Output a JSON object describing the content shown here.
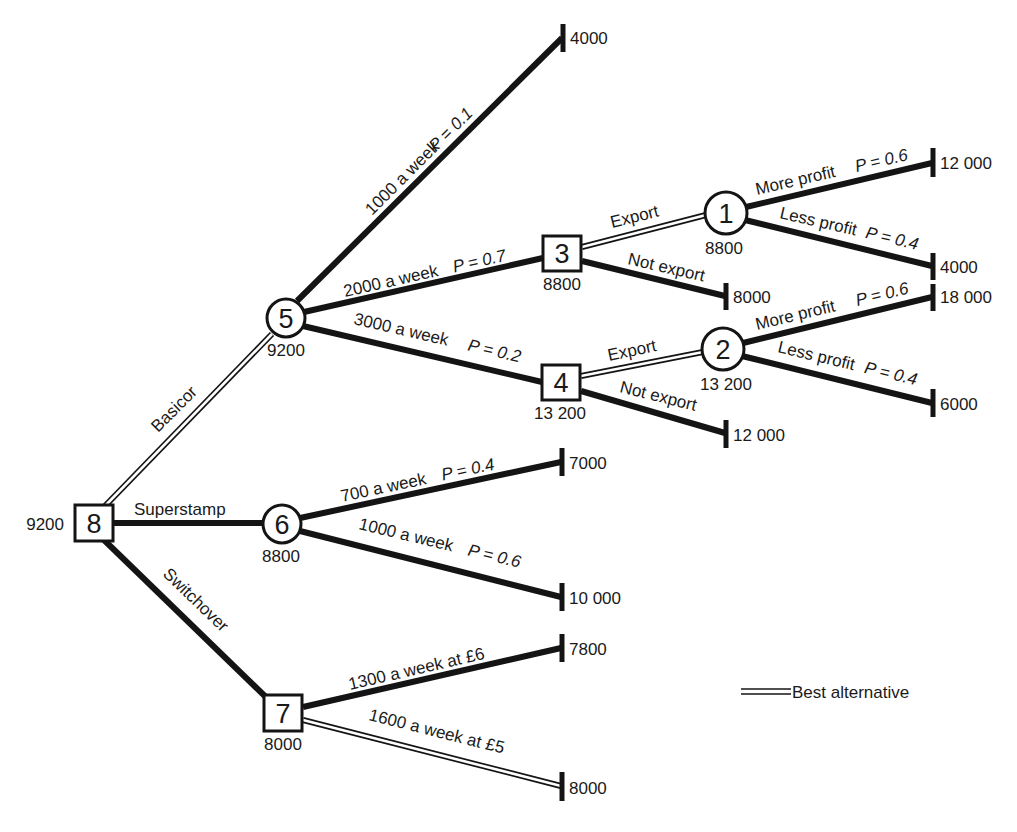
{
  "diagram": {
    "type": "decision-tree",
    "nodes": [
      {
        "id": "8",
        "kind": "decision",
        "value": "9200"
      },
      {
        "id": "5",
        "kind": "chance",
        "value": "9200"
      },
      {
        "id": "6",
        "kind": "chance",
        "value": "8800"
      },
      {
        "id": "7",
        "kind": "decision",
        "value": "8000"
      },
      {
        "id": "3",
        "kind": "decision",
        "value": "8800"
      },
      {
        "id": "4",
        "kind": "decision",
        "value": "13 200"
      },
      {
        "id": "1",
        "kind": "chance",
        "value": "8800"
      },
      {
        "id": "2",
        "kind": "chance",
        "value": "13 200"
      }
    ],
    "edges": {
      "basicor": {
        "label": "Basicor",
        "best": true
      },
      "superstamp": {
        "label": "Superstamp",
        "best": false
      },
      "switchover": {
        "label": "Switchover",
        "best": false
      },
      "n5_1000": {
        "label": "1000 a week",
        "prob": "P = 0.1"
      },
      "n5_2000": {
        "label": "2000 a week",
        "prob": "P = 0.7"
      },
      "n5_3000": {
        "label": "3000 a week",
        "prob": "P = 0.2"
      },
      "n3_export": {
        "label": "Export",
        "best": true
      },
      "n3_notexport": {
        "label": "Not export"
      },
      "n4_export": {
        "label": "Export",
        "best": true
      },
      "n4_notexport": {
        "label": "Not export"
      },
      "n1_more": {
        "label": "More profit",
        "prob": "P = 0.6"
      },
      "n1_less": {
        "label": "Less profit",
        "prob": "P = 0.4"
      },
      "n2_more": {
        "label": "More profit",
        "prob": "P = 0.6"
      },
      "n2_less": {
        "label": "Less profit",
        "prob": "P = 0.4"
      },
      "n6_700": {
        "label": "700 a week",
        "prob": "P = 0.4"
      },
      "n6_1000": {
        "label": "1000 a week",
        "prob": "P = 0.6"
      },
      "n7_1300": {
        "label": "1300 a week at £6"
      },
      "n7_1600": {
        "label": "1600 a week at £5",
        "best": true
      }
    },
    "terminals": {
      "t_n5_1000": "4000",
      "t_n1_more": "12 000",
      "t_n1_less": "4000",
      "t_n3_notexport": "8000",
      "t_n2_more": "18 000",
      "t_n2_less": "6000",
      "t_n4_notexport": "12 000",
      "t_n6_700": "7000",
      "t_n6_1000": "10 000",
      "t_n7_1300": "7800",
      "t_n7_1600": "8000"
    },
    "legend": {
      "label": "Best alternative",
      "symbol": "double-line"
    }
  }
}
